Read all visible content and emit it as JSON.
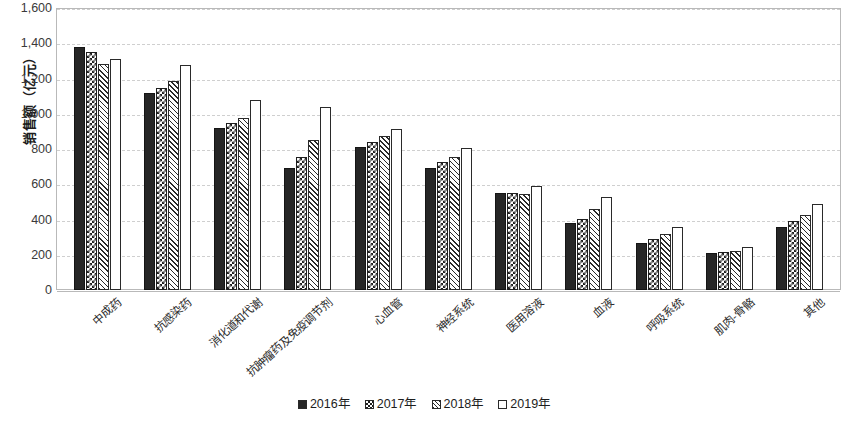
{
  "chart_data": {
    "type": "bar",
    "title": "",
    "xlabel": "",
    "ylabel": "销售额（亿元）",
    "ylim": [
      0,
      1600
    ],
    "ytick_step": 200,
    "ytick_labels": [
      "1,600",
      "1,400",
      "1,200",
      "1,000",
      "800",
      "600",
      "400",
      "200",
      "0"
    ],
    "ytick_values": [
      1600,
      1400,
      1200,
      1000,
      800,
      600,
      400,
      200,
      0
    ],
    "grid": true,
    "grid_style": "dashed-horizontal",
    "legend_position": "bottom-center",
    "categories": [
      "中成药",
      "抗感染药",
      "消化道和代谢",
      "抗肿瘤药及免疫调节剂",
      "心血管",
      "神经系统",
      "医用溶液",
      "血液",
      "呼吸系统",
      "肌肉-骨骼",
      "其他"
    ],
    "series": [
      {
        "name": "2016年",
        "pattern": "solid-black",
        "values": [
          1378,
          1118,
          920,
          695,
          810,
          690,
          550,
          378,
          265,
          210,
          358
        ]
      },
      {
        "name": "2017年",
        "pattern": "checkerboard",
        "values": [
          1352,
          1148,
          950,
          755,
          840,
          725,
          552,
          405,
          290,
          215,
          390
        ]
      },
      {
        "name": "2018年",
        "pattern": "diagonal-hatch",
        "values": [
          1280,
          1188,
          975,
          850,
          875,
          752,
          545,
          462,
          320,
          222,
          428
        ]
      },
      {
        "name": "2019年",
        "pattern": "white-outline",
        "values": [
          1312,
          1278,
          1080,
          1040,
          915,
          805,
          592,
          525,
          360,
          245,
          490
        ]
      }
    ]
  },
  "colors": {
    "axis": "#b9b9b9",
    "gridline": "#cfcfcf",
    "text": "#2b2b2b",
    "series_solid": "#262626",
    "background": "#ffffff"
  }
}
